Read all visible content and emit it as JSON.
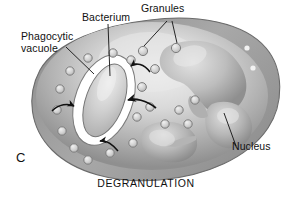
{
  "figure": {
    "panel_letter": "C",
    "caption": "DEGRANULATION"
  },
  "labels": {
    "phagocytic_vacuole_line1": "Phagocytic",
    "phagocytic_vacuole_line2": "vacuole",
    "bacterium": "Bacterium",
    "granules": "Granules",
    "nucleus": "Nucleus"
  },
  "colors": {
    "background": "#ffffff",
    "text": "#111111",
    "cell_rim": "#8d8d8d",
    "cell_mid": "#a9a9a9",
    "cell_light": "#d8d8d8",
    "cell_highlight": "#ececec",
    "cell_outline": "#6b6b6b",
    "nucleus_dark": "#8a8a8a",
    "nucleus_light": "#d2d2d2",
    "vacuole_white": "#ffffff",
    "vacuole_outline": "#7a7a7a",
    "bacterium_fill": "#c9c9c9",
    "bacterium_outline": "#707070",
    "granule_fill": "#d5d5d5",
    "granule_outline": "#7e7e7e",
    "arrow": "#111111",
    "leader_line": "#111111"
  },
  "structures": {
    "cell": {
      "name": "phagocytic cell body"
    },
    "vacuole": {
      "name": "phagocytic vacuole",
      "cx": 104,
      "cy": 100,
      "rx": 27,
      "ry": 46,
      "rotation": 20
    },
    "bacterium": {
      "name": "engulfed bacterium",
      "cx": 106,
      "cy": 100,
      "rx": 17,
      "ry": 36,
      "rotation": 20
    },
    "nucleus_lobes": [
      {
        "cx": 196,
        "cy": 62,
        "rx": 30,
        "ry": 21,
        "rotation": -18
      },
      {
        "cx": 238,
        "cy": 78,
        "rx": 22,
        "ry": 15,
        "rotation": 10
      },
      {
        "cx": 232,
        "cy": 118,
        "rx": 20,
        "ry": 17,
        "rotation": 0
      },
      {
        "cx": 168,
        "cy": 140,
        "rx": 24,
        "ry": 17,
        "rotation": 12
      }
    ],
    "granules": [
      {
        "cx": 143,
        "cy": 51,
        "r": 4.6
      },
      {
        "cx": 176,
        "cy": 48,
        "r": 4.6
      },
      {
        "cx": 131,
        "cy": 60,
        "r": 4.2
      },
      {
        "cx": 155,
        "cy": 69,
        "r": 4.4
      },
      {
        "cx": 142,
        "cy": 87,
        "r": 4.4
      },
      {
        "cx": 150,
        "cy": 107,
        "r": 4.2
      },
      {
        "cx": 179,
        "cy": 110,
        "r": 4.2
      },
      {
        "cx": 195,
        "cy": 100,
        "r": 4.2
      },
      {
        "cx": 188,
        "cy": 124,
        "r": 4.2
      },
      {
        "cx": 165,
        "cy": 124,
        "r": 4.2
      },
      {
        "cx": 137,
        "cy": 117,
        "r": 4.2
      },
      {
        "cx": 133,
        "cy": 143,
        "r": 4.2
      },
      {
        "cx": 110,
        "cy": 153,
        "r": 4.2
      },
      {
        "cx": 88,
        "cy": 160,
        "r": 4.2
      },
      {
        "cx": 74,
        "cy": 148,
        "r": 4.2
      },
      {
        "cx": 62,
        "cy": 131,
        "r": 4.2
      },
      {
        "cx": 57,
        "cy": 110,
        "r": 4.2
      },
      {
        "cx": 60,
        "cy": 89,
        "r": 4.2
      },
      {
        "cx": 70,
        "cy": 71,
        "r": 4.2
      },
      {
        "cx": 88,
        "cy": 58,
        "r": 4.2
      },
      {
        "cx": 113,
        "cy": 53,
        "r": 4.2
      },
      {
        "cx": 247,
        "cy": 48,
        "r": 2.6
      },
      {
        "cx": 253,
        "cy": 68,
        "r": 2.6
      }
    ],
    "arrows": [
      {
        "name": "granule-to-vacuole-upper",
        "path": "M 150,72 C 144,64 136,62 131,66",
        "tip": [
          131.5,
          66.5,
          200
        ]
      },
      {
        "name": "granule-to-vacuole-middle",
        "path": "M 154,108 C 145,100 134,98 127,100",
        "tip": [
          127,
          100,
          190
        ]
      },
      {
        "name": "granule-to-vacuole-lower",
        "path": "M 118,151 C 112,144 106,140 100,141",
        "tip": [
          100,
          141,
          196
        ]
      },
      {
        "name": "granule-to-vacuole-left",
        "path": "M 52,111 C 59,104 68,103 74,106",
        "tip": [
          74.5,
          106.5,
          20
        ]
      }
    ]
  },
  "leader_lines": [
    {
      "name": "phagocytic-vacuole-leader",
      "x1": 66,
      "y1": 47,
      "x2": 94,
      "y2": 74
    },
    {
      "name": "bacterium-leader",
      "x1": 108,
      "y1": 24,
      "x2": 110,
      "y2": 76
    },
    {
      "name": "granules-leader-left",
      "x1": 167,
      "y1": 21,
      "x2": 144,
      "y2": 46
    },
    {
      "name": "granules-leader-right",
      "x1": 172,
      "y1": 21,
      "x2": 177,
      "y2": 43
    },
    {
      "name": "nucleus-leader",
      "x1": 236,
      "y1": 146,
      "x2": 224,
      "y2": 113
    }
  ]
}
